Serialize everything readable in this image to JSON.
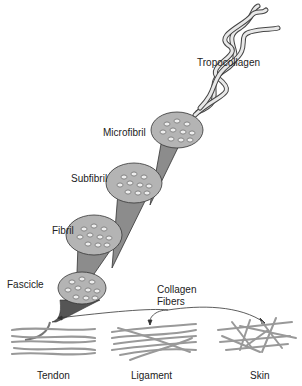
{
  "diagram": {
    "labels": {
      "tropocollagen": "Tropocollagen",
      "microfibril": "Microfibril",
      "subfibril": "Subfibril",
      "fibril": "Fibril",
      "fascicle": "Fascicle",
      "collagen_fibers_line1": "Collagen",
      "collagen_fibers_line2": "Fibers",
      "tendon": "Tendon",
      "ligament": "Ligament",
      "skin": "Skin"
    },
    "colors": {
      "cone_fill": "#8c8c8c",
      "cone_face": "#b4b4b4",
      "fiber": "#aaaaaa",
      "outline": "#333333"
    }
  }
}
